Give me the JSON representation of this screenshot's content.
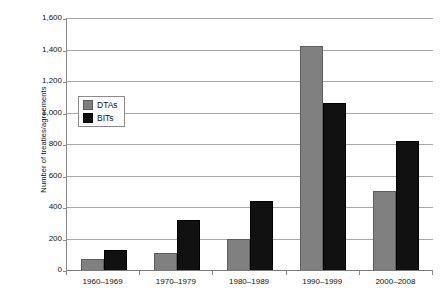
{
  "chart_data": {
    "type": "bar",
    "title": "",
    "subtitle": "",
    "xlabel": "",
    "ylabel": "Number of treaties/agreements",
    "categories": [
      "1960–1969",
      "1970–1979",
      "1980–1989",
      "1990–1999",
      "2000–2008"
    ],
    "series": [
      {
        "name": "DTAs",
        "color": "#808080",
        "values": [
          70,
          105,
          195,
          1420,
          500
        ]
      },
      {
        "name": "BITs",
        "color": "#111111",
        "values": [
          125,
          320,
          440,
          1060,
          820
        ]
      }
    ],
    "ylim": [
      0,
      1600
    ],
    "ytick_values": [
      0,
      200,
      400,
      600,
      800,
      1000,
      1200,
      1400,
      1600
    ],
    "ytick_labels": [
      "0",
      "200",
      "400",
      "600",
      "800",
      "1,000",
      "1,200",
      "1,400",
      "1,600"
    ],
    "grid": "horizontal",
    "legend_position": "inside-upper-left",
    "bar_mode": "grouped"
  },
  "legend": {
    "items": [
      {
        "label": "DTAs",
        "swatch": "legend-swatch-gray"
      },
      {
        "label": "BITs",
        "swatch": "legend-swatch-black"
      }
    ]
  }
}
